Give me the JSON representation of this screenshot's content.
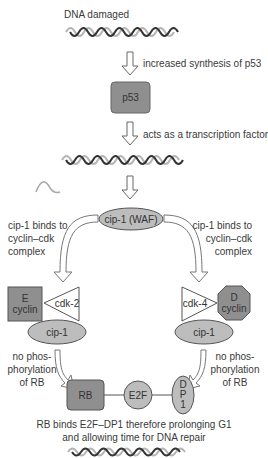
{
  "colors": {
    "dark_fill": "#8f8f8f",
    "light_fill": "#bdbdbd",
    "stroke": "#555555",
    "dna_dark": "#333333",
    "dna_light": "#b5b5b5"
  },
  "labels": {
    "dna_damaged": "DNA damaged",
    "increased_synthesis": "increased synthesis of p53",
    "p53": "p53",
    "transcription_factor": "acts as a transcription factor",
    "cip1_waf": "cip-1 (WAF)",
    "left_binds": [
      "cip-1 binds to",
      "cyclin–cdk",
      "complex"
    ],
    "right_binds": [
      "cip-1 binds to",
      "cyclin–cdk",
      "complex"
    ],
    "e_cyclin": [
      "E",
      "cyclin"
    ],
    "cdk2": "cdk-2",
    "cdk4": "cdk-4",
    "d_cyclin": [
      "D",
      "cyclin"
    ],
    "cip1_left": "cip-1",
    "cip1_right": "cip-1",
    "left_nophos": [
      "no phos-",
      "phorylation",
      "of RB"
    ],
    "right_nophos": [
      "no phos-",
      "phorylation",
      "of RB"
    ],
    "rb": "RB",
    "e2f": "E2F",
    "dp1": [
      "D",
      "P",
      "1"
    ],
    "conclusion": [
      "RB binds E2F–DP1 therefore prolonging G1",
      "and allowing time for DNA repair"
    ]
  }
}
